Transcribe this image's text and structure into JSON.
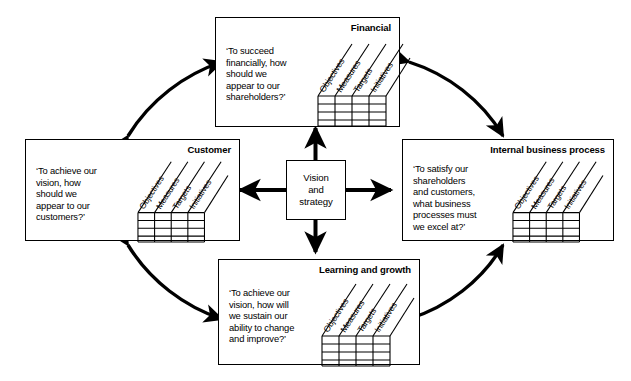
{
  "diagram": {
    "type": "balanced-scorecard",
    "background_color": "#ffffff",
    "line_color": "#000000"
  },
  "center": {
    "label": "Vision\nand\nstrategy"
  },
  "table_headers": [
    "Objectives",
    "Measures",
    "Targets",
    "Initiatives"
  ],
  "table_rows": 4,
  "table_columns": 4,
  "perspectives": [
    {
      "id": "financial",
      "title": "Financial",
      "question": "‘To succeed\nfinancially, how\nshould we\nappear to our\nshareholders?’"
    },
    {
      "id": "customer",
      "title": "Customer",
      "question": "‘To achieve our\nvision, how\nshould we\nappear to our\ncustomers?’"
    },
    {
      "id": "internal-business-process",
      "title": "Internal business process",
      "question": "‘To satisfy our\nshareholders\nand customers,\nwhat business\nprocesses must\nwe excel at?’"
    },
    {
      "id": "learning-and-growth",
      "title": "Learning and growth",
      "question": "‘To achieve our\nvision, how will\nwe sustain our\nability to change\nand improve?’"
    }
  ],
  "connectors": {
    "center_arrows": [
      {
        "name": "center-to-financial",
        "direction": "up"
      },
      {
        "name": "center-to-customer",
        "direction": "left"
      },
      {
        "name": "center-to-internal-business-process",
        "direction": "right"
      },
      {
        "name": "center-to-learning-and-growth",
        "direction": "down"
      }
    ],
    "arcs": [
      {
        "name": "arc-customer-financial",
        "double_headed": true
      },
      {
        "name": "arc-financial-internal",
        "double_headed": true
      },
      {
        "name": "arc-customer-learning",
        "double_headed": true
      },
      {
        "name": "arc-learning-internal",
        "double_headed": true
      }
    ]
  }
}
